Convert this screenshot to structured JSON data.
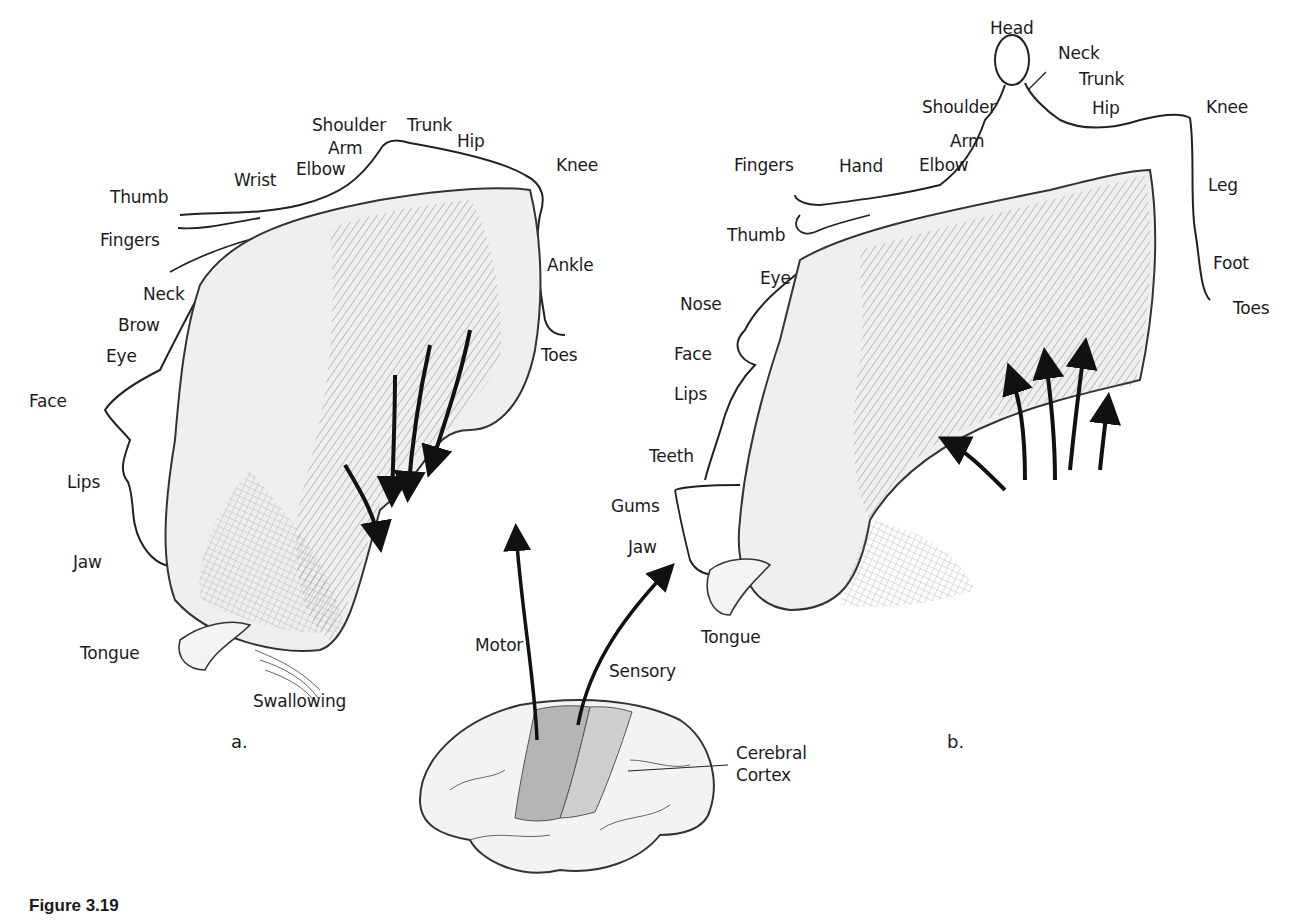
{
  "figure": {
    "caption": "Figure 3.19",
    "panel_a_letter": "a.",
    "panel_b_letter": "b."
  },
  "panel_a": {
    "title": "Motor homunculus",
    "labels": {
      "shoulder": "Shoulder",
      "trunk": "Trunk",
      "hip": "Hip",
      "arm": "Arm",
      "elbow": "Elbow",
      "wrist": "Wrist",
      "knee": "Knee",
      "thumb": "Thumb",
      "fingers": "Fingers",
      "ankle": "Ankle",
      "neck": "Neck",
      "brow": "Brow",
      "eye": "Eye",
      "toes": "Toes",
      "face": "Face",
      "lips": "Lips",
      "jaw": "Jaw",
      "tongue": "Tongue",
      "swallowing": "Swallowing"
    }
  },
  "panel_b": {
    "title": "Sensory homunculus",
    "labels": {
      "head": "Head",
      "neck": "Neck",
      "trunk": "Trunk",
      "shoulder": "Shoulder",
      "hip": "Hip",
      "knee": "Knee",
      "arm": "Arm",
      "fingers": "Fingers",
      "hand": "Hand",
      "elbow": "Elbow",
      "leg": "Leg",
      "thumb": "Thumb",
      "eye": "Eye",
      "foot": "Foot",
      "nose": "Nose",
      "toes": "Toes",
      "face": "Face",
      "lips": "Lips",
      "teeth": "Teeth",
      "gums": "Gums",
      "jaw": "Jaw",
      "tongue": "Tongue"
    }
  },
  "brain": {
    "motor_label": "Motor",
    "sensory_label": "Sensory",
    "cortex_label_line1": "Cerebral",
    "cortex_label_line2": "Cortex"
  },
  "colors": {
    "ink": "#1c1c1c",
    "cortex_fill": "#ececec",
    "cortex_shade": "#bdbdbd",
    "strip_fill": "#a9a9a9"
  }
}
